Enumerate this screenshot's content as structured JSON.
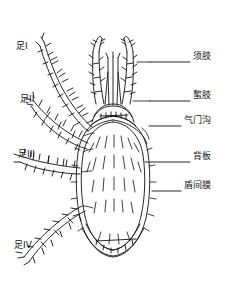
{
  "figure": {
    "kind": "anatomical-line-drawing",
    "stroke_color": "#111111",
    "background_color": "#ffffff"
  },
  "labels": {
    "left": [
      {
        "id": "leg-1",
        "text": "足I",
        "x": 16,
        "y": 47,
        "leader": null
      },
      {
        "id": "leg-2",
        "text": "足II",
        "x": 20,
        "y": 100,
        "leader": null
      },
      {
        "id": "leg-3",
        "text": "足III",
        "x": 18,
        "y": 155,
        "leader": null
      },
      {
        "id": "leg-4",
        "text": "足IV",
        "x": 14,
        "y": 246,
        "leader": null
      }
    ],
    "right": [
      {
        "id": "palp",
        "text": "须肢",
        "x": 193,
        "y": 57,
        "leader_x1": 150,
        "leader_y1": 62,
        "leader_x2": 190,
        "leader_y2": 62
      },
      {
        "id": "chelicera",
        "text": "螯肢",
        "x": 193,
        "y": 96,
        "leader_x1": 150,
        "leader_y1": 101,
        "leader_x2": 190,
        "leader_y2": 101
      },
      {
        "id": "stigmal-groove",
        "text": "气门沟",
        "x": 184,
        "y": 121,
        "leader_x1": 149,
        "leader_y1": 126,
        "leader_x2": 181,
        "leader_y2": 126
      },
      {
        "id": "dorsal-plate",
        "text": "背板",
        "x": 193,
        "y": 157,
        "leader_x1": 145,
        "leader_y1": 162,
        "leader_x2": 190,
        "leader_y2": 162
      },
      {
        "id": "interscutal-membrane",
        "text": "盾间膜",
        "x": 184,
        "y": 186,
        "leader_x1": 152,
        "leader_y1": 191,
        "leader_x2": 181,
        "leader_y2": 191
      }
    ]
  }
}
